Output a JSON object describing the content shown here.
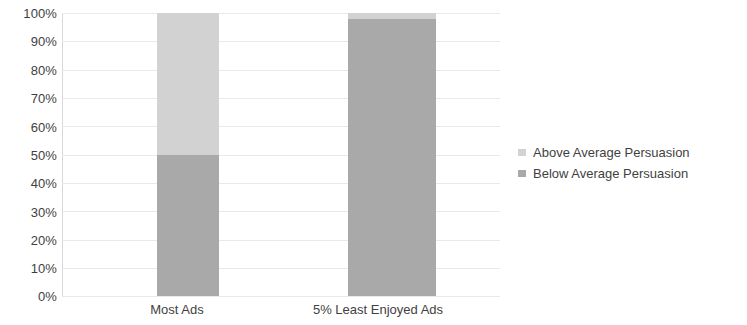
{
  "chart_data": {
    "type": "bar",
    "title": "",
    "subtitle": "",
    "xlabel": "",
    "ylabel": "",
    "stacked": true,
    "stack_total_percent": 100,
    "grid": true,
    "legend_position": "right",
    "ylim": [
      0,
      100
    ],
    "ytick_labels": [
      "100%",
      "90%",
      "80%",
      "70%",
      "60%",
      "50%",
      "40%",
      "30%",
      "20%",
      "10%",
      "0%"
    ],
    "ytick_values": [
      100,
      90,
      80,
      70,
      60,
      50,
      40,
      30,
      20,
      10,
      0
    ],
    "categories": [
      "Most Ads",
      "5% Least Enjoyed Ads"
    ],
    "series": [
      {
        "name": "Above Average Persuasion",
        "color": "#d2d2d2",
        "values": [
          50,
          2
        ]
      },
      {
        "name": "Below Average Persuasion",
        "color": "#a9a9a9",
        "values": [
          50,
          98
        ]
      }
    ]
  },
  "axis": {
    "y_ticks": [
      {
        "label": "100%"
      },
      {
        "label": "90%"
      },
      {
        "label": "80%"
      },
      {
        "label": "70%"
      },
      {
        "label": "60%"
      },
      {
        "label": "50%"
      },
      {
        "label": "40%"
      },
      {
        "label": "30%"
      },
      {
        "label": "20%"
      },
      {
        "label": "10%"
      },
      {
        "label": "0%"
      }
    ],
    "categories": [
      {
        "label": "Most Ads"
      },
      {
        "label": "5% Least Enjoyed Ads"
      }
    ]
  },
  "legend": {
    "items": [
      {
        "label": "Above Average Persuasion",
        "color": "#d2d2d2"
      },
      {
        "label": "Below Average Persuasion",
        "color": "#a9a9a9"
      }
    ]
  },
  "colors": {
    "above_average": "#d2d2d2",
    "below_average": "#a9a9a9",
    "gridline": "#e9e9ec",
    "axis_line": "#d8d8dc",
    "text": "#3f3f3f",
    "background": "#ffffff"
  }
}
